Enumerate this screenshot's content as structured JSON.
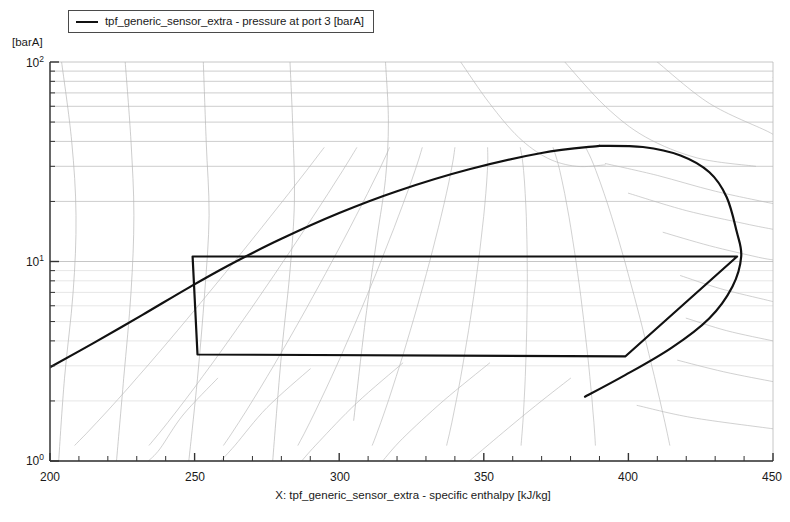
{
  "legend": {
    "entries": [
      {
        "label": "tpf_generic_sensor_extra - pressure at port 3 [barA]",
        "color": "#111111"
      }
    ]
  },
  "axes": {
    "y_unit_label": "[barA]",
    "y_ticks": [
      {
        "text": "10²",
        "mantissa": "10",
        "exponent": "2",
        "value": 100
      },
      {
        "text": "10¹",
        "mantissa": "10",
        "exponent": "1",
        "value": 10
      },
      {
        "text": "10⁰",
        "mantissa": "10",
        "exponent": "0",
        "value": 1
      }
    ],
    "x_ticks": [
      {
        "text": "200",
        "value": 200
      },
      {
        "text": "250",
        "value": 250
      },
      {
        "text": "300",
        "value": 300
      },
      {
        "text": "350",
        "value": 350
      },
      {
        "text": "400",
        "value": 400
      },
      {
        "text": "450",
        "value": 450
      }
    ],
    "x_title": "X: tpf_generic_sensor_extra - specific enthalpy [kJ/kg]"
  },
  "chart_data": {
    "type": "line",
    "title": "",
    "xlabel": "X: tpf_generic_sensor_extra - specific enthalpy [kJ/kg]",
    "ylabel": "[barA]",
    "xlim": [
      200,
      450
    ],
    "ylim": [
      1,
      100
    ],
    "yscale": "log",
    "xscale": "linear",
    "grid": true,
    "legend_position": "top-left-outside",
    "series": [
      {
        "name": "tpf_generic_sensor_extra - pressure at port 3 [barA]",
        "type": "cycle-path",
        "color": "#111111",
        "width": 2.2,
        "points": [
          [
            249.3,
            10.6
          ],
          [
            437.6,
            10.6
          ],
          [
            399.0,
            3.35
          ],
          [
            251.0,
            3.42
          ],
          [
            249.3,
            10.6
          ]
        ],
        "annotation": "Closed thermodynamic cycle: evaporation at ~3.4 barA, compression to ~10.6 barA, condensation, expansion"
      },
      {
        "name": "saturation dome",
        "type": "envelope",
        "color": "#111111",
        "width": 2.2,
        "critical_point": [
          390.0,
          38.0
        ],
        "liquid_branch": [
          [
            200.0,
            2.95
          ],
          [
            215.0,
            3.9
          ],
          [
            232.0,
            5.4
          ],
          [
            248.0,
            7.4
          ],
          [
            262.0,
            9.6
          ],
          [
            280.0,
            13.0
          ],
          [
            300.0,
            17.5
          ],
          [
            320.0,
            22.5
          ],
          [
            345.0,
            29.0
          ],
          [
            370.0,
            35.0
          ],
          [
            390.0,
            38.0
          ]
        ],
        "vapour_branch": [
          [
            390.0,
            38.0
          ],
          [
            405.0,
            37.5
          ],
          [
            418.0,
            34.0
          ],
          [
            428.0,
            28.0
          ],
          [
            434.0,
            21.0
          ],
          [
            437.5,
            14.0
          ],
          [
            439.0,
            10.6
          ],
          [
            436.0,
            7.5
          ],
          [
            428.0,
            5.2
          ],
          [
            415.0,
            3.7
          ],
          [
            399.0,
            2.7
          ],
          [
            385.0,
            2.1
          ]
        ]
      }
    ],
    "background_grid": {
      "isotherms_superheat": 7,
      "quality_lines_in_dome": 9,
      "isotherms_liquid": 5,
      "horizontal_gridlines_decade_minor": [
        2,
        3,
        4,
        5,
        6,
        7,
        8,
        9,
        20,
        30,
        40,
        50,
        60,
        70,
        80,
        90
      ]
    }
  },
  "colors": {
    "series": "#111111",
    "grid_major": "#b8b8b8",
    "grid_minor": "#dcdcdc",
    "axis": "#333333",
    "background": "#ffffff"
  }
}
